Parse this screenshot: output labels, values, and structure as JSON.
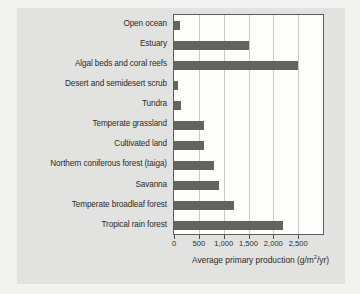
{
  "chart_data": {
    "type": "bar",
    "orientation": "horizontal",
    "title": "",
    "xlabel": "Average primary production (g/m2/yr)",
    "ylabel": "",
    "categories": [
      "Open ocean",
      "Estuary",
      "Algal beds and coral reefs",
      "Desert and semidesert scrub",
      "Tundra",
      "Temperate grassland",
      "Cultivated land",
      "Northern coniferous forest (taiga)",
      "Savanna",
      "Temperate broadleaf forest",
      "Tropical rain forest"
    ],
    "values": [
      125,
      1500,
      2500,
      90,
      140,
      600,
      600,
      800,
      900,
      1200,
      2200
    ],
    "xlim": [
      0,
      3000
    ],
    "xticks": [
      0,
      500,
      1000,
      1500,
      2000,
      2500
    ],
    "xtick_labels": [
      "0",
      "500",
      "1,000",
      "1,500",
      "2,000",
      "2,500"
    ],
    "grid": true,
    "legend": "none",
    "bar_color": "#63635f",
    "plot_bg": "#fdfdfc",
    "panel_bg": "#e2e2e0",
    "gridline_color": "#c9c9c6",
    "axis_color": "#5d5d5d"
  },
  "axis_title_parts": {
    "prefix": "Average primary production (g/m",
    "superscript": "2",
    "suffix": "/yr)"
  }
}
